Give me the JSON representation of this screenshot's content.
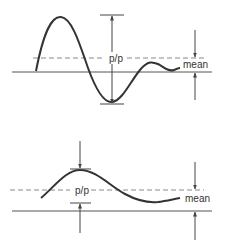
{
  "diagrams": [
    {
      "id": "top",
      "pp_label": "p/p",
      "mean_label": "mean",
      "description": "Large amplitude damped oscillation; peak-to-peak measured from crest to trough"
    },
    {
      "id": "bottom",
      "pp_label": "p/p",
      "mean_label": "mean",
      "description": "Small amplitude smooth wave; peak-to-peak indicated by inward arrows"
    }
  ],
  "colors": {
    "wave": "#333333",
    "baseline": "#555555",
    "dashed": "#888888",
    "arrow": "#444444"
  }
}
